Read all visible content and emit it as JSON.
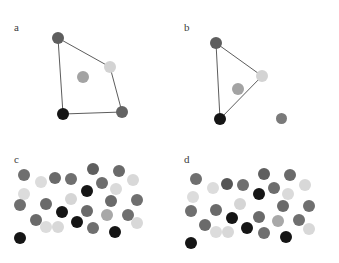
{
  "figure": {
    "width": 339,
    "height": 263,
    "background": "#ffffff",
    "type": "multi-panel-scatter-diagram",
    "panel_count": 4
  },
  "chart_data": {
    "type": "scatter",
    "title": "",
    "xlabel": "",
    "ylabel": "",
    "grid": false,
    "legend": null,
    "axis_visible": false,
    "panels": [
      {
        "id": "a",
        "label": "a",
        "label_x": 14,
        "label_y": 22,
        "origin_x": 0,
        "origin_y": 0,
        "has_edges": true,
        "points": [
          {
            "x": 58,
            "y": 38,
            "r": 6.0,
            "color": "#5e5e5e",
            "on_hull": true,
            "name": "point-top-left"
          },
          {
            "x": 110,
            "y": 67,
            "r": 6.0,
            "color": "#d3d3d3",
            "on_hull": true,
            "name": "point-right-light"
          },
          {
            "x": 122,
            "y": 112,
            "r": 6.0,
            "color": "#636363",
            "on_hull": true,
            "name": "point-bottom-right"
          },
          {
            "x": 63,
            "y": 114,
            "r": 6.0,
            "color": "#151515",
            "on_hull": true,
            "name": "point-bottom-left-black"
          },
          {
            "x": 83,
            "y": 77,
            "r": 6.0,
            "color": "#a3a3a3",
            "on_hull": false,
            "name": "point-interior"
          }
        ],
        "edges": [
          {
            "from": 0,
            "to": 1
          },
          {
            "from": 1,
            "to": 2
          },
          {
            "from": 2,
            "to": 3
          },
          {
            "from": 3,
            "to": 0
          }
        ]
      },
      {
        "id": "b",
        "label": "b",
        "label_x": 14,
        "label_y": 22,
        "origin_x": 170,
        "origin_y": 0,
        "has_edges": true,
        "points": [
          {
            "x": 46,
            "y": 43,
            "r": 6.0,
            "color": "#5e5e5e",
            "on_hull": true,
            "name": "point-top-left"
          },
          {
            "x": 92,
            "y": 76,
            "r": 6.0,
            "color": "#d3d3d3",
            "on_hull": true,
            "name": "point-right-light"
          },
          {
            "x": 50,
            "y": 119,
            "r": 6.0,
            "color": "#151515",
            "on_hull": true,
            "name": "point-bottom-left-black"
          },
          {
            "x": 68,
            "y": 89,
            "r": 6.0,
            "color": "#a3a3a3",
            "on_hull": false,
            "name": "point-interior"
          },
          {
            "x": 111,
            "y": 118,
            "r": 5.5,
            "color": "#7a7a7a",
            "on_hull": false,
            "name": "point-outlier-bottom-right"
          }
        ],
        "edges": [
          {
            "from": 0,
            "to": 1
          },
          {
            "from": 1,
            "to": 2
          },
          {
            "from": 2,
            "to": 0
          }
        ]
      },
      {
        "id": "c",
        "label": "c",
        "label_x": 14,
        "label_y": 22,
        "origin_x": 0,
        "origin_y": 132,
        "has_edges": false,
        "points": [
          {
            "x": 24,
            "y": 43,
            "r": 6.0,
            "color": "#6f6f6f",
            "name": "dot"
          },
          {
            "x": 41,
            "y": 50,
            "r": 6.0,
            "color": "#dcdcdc",
            "name": "dot"
          },
          {
            "x": 55,
            "y": 46,
            "r": 6.0,
            "color": "#6a6a6a",
            "name": "dot"
          },
          {
            "x": 71,
            "y": 47,
            "r": 6.0,
            "color": "#6f6f6f",
            "name": "dot"
          },
          {
            "x": 93,
            "y": 37,
            "r": 6.0,
            "color": "#5f5f5f",
            "name": "dot"
          },
          {
            "x": 102,
            "y": 51,
            "r": 6.0,
            "color": "#6d6d6d",
            "name": "dot"
          },
          {
            "x": 119,
            "y": 39,
            "r": 6.0,
            "color": "#6a6a6a",
            "name": "dot"
          },
          {
            "x": 133,
            "y": 48,
            "r": 6.0,
            "color": "#d8d8d8",
            "name": "dot"
          },
          {
            "x": 24,
            "y": 62,
            "r": 6.0,
            "color": "#dcdcdc",
            "name": "dot"
          },
          {
            "x": 87,
            "y": 59,
            "r": 6.0,
            "color": "#161616",
            "name": "dot"
          },
          {
            "x": 116,
            "y": 57,
            "r": 6.0,
            "color": "#dadada",
            "name": "dot"
          },
          {
            "x": 71,
            "y": 67,
            "r": 6.0,
            "color": "#d5d5d5",
            "name": "dot"
          },
          {
            "x": 20,
            "y": 73,
            "r": 6.0,
            "color": "#6f6f6f",
            "name": "dot"
          },
          {
            "x": 46,
            "y": 72,
            "r": 6.0,
            "color": "#6a6a6a",
            "name": "dot"
          },
          {
            "x": 111,
            "y": 69,
            "r": 6.0,
            "color": "#6a6a6a",
            "name": "dot"
          },
          {
            "x": 137,
            "y": 68,
            "r": 6.0,
            "color": "#6f6f6f",
            "name": "dot"
          },
          {
            "x": 62,
            "y": 80,
            "r": 6.0,
            "color": "#151515",
            "name": "dot"
          },
          {
            "x": 87,
            "y": 79,
            "r": 6.0,
            "color": "#6a6a6a",
            "name": "dot"
          },
          {
            "x": 107,
            "y": 83,
            "r": 6.0,
            "color": "#a8a8a8",
            "name": "dot"
          },
          {
            "x": 128,
            "y": 83,
            "r": 6.0,
            "color": "#6f6f6f",
            "name": "dot"
          },
          {
            "x": 36,
            "y": 88,
            "r": 6.0,
            "color": "#6a6a6a",
            "name": "dot"
          },
          {
            "x": 46,
            "y": 95,
            "r": 6.0,
            "color": "#dcdcdc",
            "name": "dot"
          },
          {
            "x": 58,
            "y": 95,
            "r": 6.0,
            "color": "#d8d8d8",
            "name": "dot"
          },
          {
            "x": 77,
            "y": 90,
            "r": 6.0,
            "color": "#151515",
            "name": "dot"
          },
          {
            "x": 93,
            "y": 96,
            "r": 6.0,
            "color": "#6f6f6f",
            "name": "dot"
          },
          {
            "x": 137,
            "y": 91,
            "r": 6.0,
            "color": "#d8d8d8",
            "name": "dot"
          },
          {
            "x": 115,
            "y": 100,
            "r": 6.0,
            "color": "#151515",
            "name": "dot"
          },
          {
            "x": 20,
            "y": 106,
            "r": 6.0,
            "color": "#151515",
            "name": "dot"
          }
        ],
        "edges": []
      },
      {
        "id": "d",
        "label": "d",
        "label_x": 14,
        "label_y": 22,
        "origin_x": 170,
        "origin_y": 132,
        "has_edges": false,
        "points": [
          {
            "x": 26,
            "y": 47,
            "r": 6.0,
            "color": "#6f6f6f",
            "name": "dot"
          },
          {
            "x": 43,
            "y": 56,
            "r": 6.0,
            "color": "#dcdcdc",
            "name": "dot"
          },
          {
            "x": 57,
            "y": 52,
            "r": 6.0,
            "color": "#555555",
            "name": "dot"
          },
          {
            "x": 73,
            "y": 53,
            "r": 6.0,
            "color": "#6f6f6f",
            "name": "dot"
          },
          {
            "x": 94,
            "y": 42,
            "r": 6.0,
            "color": "#5f5f5f",
            "name": "dot"
          },
          {
            "x": 104,
            "y": 56,
            "r": 6.0,
            "color": "#6d6d6d",
            "name": "dot"
          },
          {
            "x": 120,
            "y": 43,
            "r": 6.0,
            "color": "#6a6a6a",
            "name": "dot"
          },
          {
            "x": 135,
            "y": 53,
            "r": 6.0,
            "color": "#d8d8d8",
            "name": "dot"
          },
          {
            "x": 23,
            "y": 65,
            "r": 6.0,
            "color": "#dcdcdc",
            "name": "dot"
          },
          {
            "x": 89,
            "y": 62,
            "r": 6.0,
            "color": "#161616",
            "name": "dot"
          },
          {
            "x": 118,
            "y": 62,
            "r": 6.0,
            "color": "#dadada",
            "name": "dot"
          },
          {
            "x": 70,
            "y": 72,
            "r": 6.0,
            "color": "#d5d5d5",
            "name": "dot"
          },
          {
            "x": 21,
            "y": 79,
            "r": 6.0,
            "color": "#6f6f6f",
            "name": "dot"
          },
          {
            "x": 46,
            "y": 78,
            "r": 6.0,
            "color": "#6a6a6a",
            "name": "dot"
          },
          {
            "x": 113,
            "y": 74,
            "r": 6.0,
            "color": "#6a6a6a",
            "name": "dot"
          },
          {
            "x": 139,
            "y": 74,
            "r": 6.0,
            "color": "#6f6f6f",
            "name": "dot"
          },
          {
            "x": 62,
            "y": 86,
            "r": 6.0,
            "color": "#151515",
            "name": "dot"
          },
          {
            "x": 89,
            "y": 85,
            "r": 6.0,
            "color": "#6a6a6a",
            "name": "dot"
          },
          {
            "x": 108,
            "y": 89,
            "r": 6.0,
            "color": "#a8a8a8",
            "name": "dot"
          },
          {
            "x": 129,
            "y": 88,
            "r": 6.0,
            "color": "#6f6f6f",
            "name": "dot"
          },
          {
            "x": 35,
            "y": 93,
            "r": 6.0,
            "color": "#6a6a6a",
            "name": "dot"
          },
          {
            "x": 46,
            "y": 100,
            "r": 6.0,
            "color": "#dcdcdc",
            "name": "dot"
          },
          {
            "x": 58,
            "y": 100,
            "r": 6.0,
            "color": "#d8d8d8",
            "name": "dot"
          },
          {
            "x": 77,
            "y": 96,
            "r": 6.0,
            "color": "#151515",
            "name": "dot"
          },
          {
            "x": 94,
            "y": 101,
            "r": 6.0,
            "color": "#6f6f6f",
            "name": "dot"
          },
          {
            "x": 139,
            "y": 97,
            "r": 6.0,
            "color": "#d8d8d8",
            "name": "dot"
          },
          {
            "x": 116,
            "y": 105,
            "r": 6.0,
            "color": "#151515",
            "name": "dot"
          },
          {
            "x": 21,
            "y": 111,
            "r": 6.0,
            "color": "#151515",
            "name": "dot"
          }
        ],
        "edges": []
      }
    ],
    "palette": {
      "black": "#151515",
      "dark_gray": "#5e5e5e",
      "mid_gray": "#6f6f6f",
      "light_mid_gray": "#a8a8a8",
      "light_gray": "#d8d8d8",
      "edge_stroke": "#4a4a4a",
      "label_color": "#3b3b3b",
      "background": "#ffffff"
    }
  }
}
